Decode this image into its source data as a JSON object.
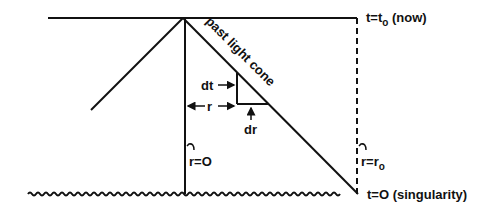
{
  "diagram": {
    "labels": {
      "now": "t=t",
      "now_sub": "o",
      "now_suffix": " (now)",
      "singularity": "t=O (singularity)",
      "light_cone": "past light cone",
      "dt": "dt",
      "r": "r",
      "dr": "dr",
      "r_zero": "r=O",
      "r_obs": "r=r",
      "r_obs_sub": "o"
    },
    "colors": {
      "ink": "#111111",
      "background": "#ffffff"
    }
  }
}
